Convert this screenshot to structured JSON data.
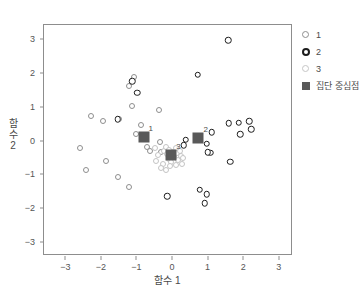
{
  "chart_data": {
    "type": "scatter",
    "title": "",
    "xlabel": "함수 1",
    "ylabel": "함수 2",
    "xlim": [
      -3.6,
      3.4
    ],
    "ylim": [
      -3.4,
      3.4
    ],
    "xticks": [
      -3,
      -2,
      -1,
      0,
      1,
      2,
      3
    ],
    "yticks": [
      3,
      2,
      1,
      0,
      -1,
      -2,
      -3
    ],
    "grid": false,
    "legend_position": "right",
    "legend": [
      {
        "key": "circle-light",
        "label": "1"
      },
      {
        "key": "circle-dark",
        "label": "2"
      },
      {
        "key": "circle-pale",
        "label": "3"
      },
      {
        "key": "square-dark",
        "label": "집단 중심점"
      }
    ],
    "series": [
      {
        "name": "1",
        "marker": "open-circle-gray",
        "color": "#8e8e8e",
        "points": [
          [
            -2.6,
            -0.23
          ],
          [
            -2.28,
            0.72
          ],
          [
            -1.93,
            0.57
          ],
          [
            -1.85,
            -0.61
          ],
          [
            -2.42,
            -0.88
          ],
          [
            -1.52,
            -1.07
          ],
          [
            -1.48,
            0.62
          ],
          [
            -1.22,
            1.6
          ],
          [
            -1.2,
            -1.38
          ],
          [
            -1.14,
            1.02
          ],
          [
            -1.06,
            1.88
          ],
          [
            -1.02,
            0.18
          ],
          [
            -0.86,
            0.47
          ],
          [
            -0.7,
            -0.2
          ],
          [
            -0.62,
            -0.31
          ],
          [
            -0.38,
            0.9
          ],
          [
            -0.34,
            -0.05
          ],
          [
            -0.3,
            -0.34
          ]
        ]
      },
      {
        "name": "2",
        "marker": "open-circle-black",
        "color": "#1c1c1c",
        "points": [
          [
            1.58,
            2.95
          ],
          [
            0.72,
            1.93
          ],
          [
            -1.12,
            1.74
          ],
          [
            -0.98,
            1.4
          ],
          [
            -1.52,
            0.62
          ],
          [
            1.6,
            0.51
          ],
          [
            1.87,
            0.52
          ],
          [
            2.17,
            0.56
          ],
          [
            2.22,
            0.33
          ],
          [
            1.92,
            0.19
          ],
          [
            1.11,
            0.25
          ],
          [
            0.38,
            0.02
          ],
          [
            0.33,
            -0.14
          ],
          [
            0.97,
            -0.09
          ],
          [
            1.08,
            -0.36
          ],
          [
            1.01,
            -0.35
          ],
          [
            1.63,
            -0.62
          ],
          [
            0.78,
            -1.45
          ],
          [
            0.97,
            -1.58
          ],
          [
            0.92,
            -1.85
          ],
          [
            -0.13,
            -1.64
          ]
        ]
      },
      {
        "name": "3",
        "marker": "open-circle-pale",
        "color": "#c4c4c4",
        "points": [
          [
            -0.48,
            -0.21
          ],
          [
            -0.4,
            -0.44
          ],
          [
            -0.22,
            -0.3
          ],
          [
            -0.18,
            -0.18
          ],
          [
            -0.14,
            -0.4
          ],
          [
            -0.1,
            -0.55
          ],
          [
            -0.08,
            -0.28
          ],
          [
            -0.04,
            -0.62
          ],
          [
            -0.02,
            -0.42
          ],
          [
            0.02,
            -0.34
          ],
          [
            0.06,
            -0.5
          ],
          [
            0.1,
            -0.72
          ],
          [
            0.14,
            -0.38
          ],
          [
            0.18,
            -0.56
          ],
          [
            0.22,
            -0.3
          ],
          [
            0.24,
            -0.46
          ],
          [
            0.28,
            -0.68
          ],
          [
            -0.26,
            -0.7
          ],
          [
            -0.32,
            -0.82
          ],
          [
            -0.16,
            -0.86
          ],
          [
            -0.44,
            -0.6
          ],
          [
            0.32,
            -0.52
          ],
          [
            0.1,
            -0.22
          ],
          [
            -0.06,
            -0.76
          ]
        ]
      }
    ],
    "centroids": [
      {
        "label": "1",
        "x": -0.8,
        "y": 0.11
      },
      {
        "label": "2",
        "x": 0.74,
        "y": 0.07
      },
      {
        "label": "3",
        "x": -0.02,
        "y": -0.43
      }
    ]
  }
}
